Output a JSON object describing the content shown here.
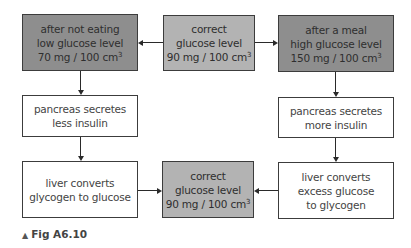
{
  "diagram": {
    "boxes": {
      "fasting": {
        "line1": "after not eating",
        "line2": "low glucose level",
        "line3": "70 mg / 100 cm",
        "sup": "3"
      },
      "correct_top": {
        "line1": "correct",
        "line2": "glucose level",
        "line3": "90 mg / 100 cm",
        "sup": "3"
      },
      "after_meal": {
        "line1": "after a meal",
        "line2": "high glucose level",
        "line3": "150 mg / 100 cm",
        "sup": "3"
      },
      "pancreas_less": {
        "line1": "pancreas secretes",
        "line2": "less insulin"
      },
      "pancreas_more": {
        "line1": "pancreas secretes",
        "line2": "more insulin"
      },
      "liver_to_glucose": {
        "line1": "liver converts",
        "line2": "glycogen to glucose"
      },
      "correct_bottom": {
        "line1": "correct",
        "line2": "glucose level",
        "line3": "90 mg / 100 cm",
        "sup": "3"
      },
      "liver_to_glycogen": {
        "line1": "liver converts",
        "line2": "excess glucose",
        "line3": "to glycogen"
      }
    },
    "colors": {
      "dark_fill": "#8e8e8e",
      "mid_fill": "#b3b3b3",
      "white_fill": "#ffffff",
      "border": "#3c3c3c"
    }
  },
  "caption": {
    "marker": "▲",
    "label": "Fig A6.10"
  }
}
